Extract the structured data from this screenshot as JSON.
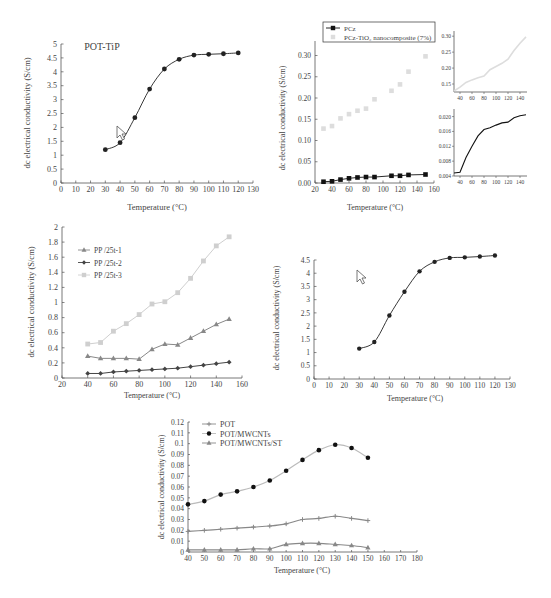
{
  "figure": {
    "caption_text": ""
  },
  "chart_data": [
    {
      "id": "panel-a",
      "type": "line",
      "title": "POT-TiP",
      "xlabel": "Temperature (°C)",
      "ylabel": "dc electrical conductivity (S/cm)",
      "xlim": [
        0,
        130
      ],
      "ylim": [
        0,
        5
      ],
      "xticks": [
        0,
        10,
        20,
        30,
        40,
        50,
        60,
        70,
        80,
        90,
        100,
        110,
        120,
        130
      ],
      "yticks": [
        0,
        0.5,
        1,
        1.5,
        2,
        2.5,
        3,
        3.5,
        4,
        4.5,
        5
      ],
      "grid": false,
      "legend": null,
      "annotation": "cursor-arrow near (44, 1.8)",
      "series": [
        {
          "name": "POT-TiP",
          "color": "#222222",
          "marker": "circle",
          "smooth": true,
          "x": [
            30,
            40,
            50,
            60,
            70,
            80,
            90,
            100,
            110,
            120
          ],
          "y": [
            1.2,
            1.45,
            2.35,
            3.38,
            4.1,
            4.45,
            4.6,
            4.63,
            4.65,
            4.68
          ]
        }
      ]
    },
    {
      "id": "panel-b",
      "type": "scatter",
      "title": "",
      "xlabel": "Temperature (°C)",
      "ylabel": "dc electrical conductivity (S/cm)",
      "xlim": [
        20,
        160
      ],
      "ylim": [
        0,
        0.32
      ],
      "xticks": [
        20,
        40,
        60,
        80,
        100,
        120,
        140,
        160
      ],
      "yticks": [
        0.0,
        0.05,
        0.1,
        0.15,
        0.2,
        0.25,
        0.3
      ],
      "ytick_labels": [
        "0.00",
        "0.05",
        "0.10",
        "0.15",
        "0.20",
        "0.25",
        "0.30"
      ],
      "grid": false,
      "legend": {
        "position": "top",
        "entries": [
          "PCz",
          "PCz-TiO₂ nanocomposite (7%)"
        ]
      },
      "series": [
        {
          "name": "PCz",
          "color": "#111111",
          "marker": "square",
          "line": true,
          "x": [
            30,
            40,
            50,
            60,
            70,
            80,
            90,
            110,
            120,
            130,
            150
          ],
          "y": [
            0.003,
            0.004,
            0.008,
            0.011,
            0.013,
            0.014,
            0.014,
            0.017,
            0.017,
            0.019,
            0.02
          ]
        },
        {
          "name": "PCz-TiO₂ nanocomposite (7%)",
          "color": "#dddddd",
          "marker": "square",
          "line": false,
          "x": [
            30,
            40,
            50,
            60,
            70,
            80,
            90,
            110,
            120,
            130,
            150
          ],
          "y": [
            0.128,
            0.134,
            0.152,
            0.162,
            0.17,
            0.175,
            0.197,
            0.217,
            0.232,
            0.262,
            0.298
          ]
        }
      ],
      "insets": [
        {
          "id": "inset-top",
          "xticks": [
            40,
            60,
            80,
            100,
            120,
            140
          ],
          "ytick_labels": [
            "0.15",
            "0.20",
            "0.25",
            "0.30"
          ],
          "yticks": [
            0.15,
            0.2,
            0.25,
            0.3
          ],
          "xlim": [
            30,
            150
          ],
          "ylim": [
            0.125,
            0.31
          ],
          "color": "#dddddd",
          "x": [
            30,
            40,
            50,
            60,
            70,
            80,
            90,
            100,
            110,
            120,
            130,
            140,
            150
          ],
          "y": [
            0.128,
            0.14,
            0.155,
            0.163,
            0.17,
            0.175,
            0.195,
            0.205,
            0.215,
            0.228,
            0.255,
            0.278,
            0.298
          ]
        },
        {
          "id": "inset-bottom",
          "xticks": [
            40,
            60,
            80,
            100,
            120,
            140
          ],
          "ytick_labels": [
            "0.004",
            "0.008",
            "0.012",
            "0.016",
            "0.020"
          ],
          "yticks": [
            0.004,
            0.008,
            0.012,
            0.016,
            0.02
          ],
          "xlim": [
            30,
            150
          ],
          "ylim": [
            0.004,
            0.0215
          ],
          "color": "#111111",
          "x": [
            30,
            40,
            50,
            60,
            70,
            80,
            90,
            100,
            110,
            120,
            130,
            140,
            150
          ],
          "y": [
            0.0048,
            0.005,
            0.009,
            0.012,
            0.0148,
            0.0165,
            0.017,
            0.0177,
            0.0183,
            0.0185,
            0.0197,
            0.0202,
            0.0205
          ]
        }
      ]
    },
    {
      "id": "panel-c",
      "type": "line",
      "title": "",
      "xlabel": "Temperature (°C)",
      "ylabel": "dc electrical conductivity (S/cm)",
      "xlim": [
        20,
        160
      ],
      "ylim": [
        0,
        2
      ],
      "xticks": [
        20,
        40,
        60,
        80,
        100,
        120,
        140,
        160
      ],
      "yticks": [
        0,
        0.2,
        0.4,
        0.6,
        0.8,
        1,
        1.2,
        1.4,
        1.6,
        1.8,
        2
      ],
      "grid": false,
      "legend": {
        "position": "upper-left",
        "entries": [
          "PP /25t-1",
          "PP /25t-2",
          "PP /25t-3"
        ]
      },
      "series": [
        {
          "name": "PP /25t-1",
          "color": "#888888",
          "marker": "triangle",
          "x": [
            40,
            50,
            60,
            70,
            80,
            90,
            100,
            110,
            120,
            130,
            140,
            150
          ],
          "y": [
            0.29,
            0.26,
            0.26,
            0.26,
            0.25,
            0.38,
            0.45,
            0.44,
            0.53,
            0.62,
            0.71,
            0.78
          ]
        },
        {
          "name": "PP /25t-2",
          "color": "#444444",
          "marker": "diamond",
          "x": [
            40,
            50,
            60,
            70,
            80,
            90,
            100,
            110,
            120,
            130,
            140,
            150
          ],
          "y": [
            0.06,
            0.06,
            0.08,
            0.09,
            0.1,
            0.11,
            0.12,
            0.13,
            0.15,
            0.17,
            0.19,
            0.21
          ]
        },
        {
          "name": "PP /25t-3",
          "color": "#cfcfcf",
          "marker": "square",
          "x": [
            40,
            50,
            60,
            70,
            80,
            90,
            100,
            110,
            120,
            130,
            140,
            150
          ],
          "y": [
            0.45,
            0.47,
            0.62,
            0.72,
            0.84,
            0.98,
            1.01,
            1.13,
            1.32,
            1.55,
            1.75,
            1.87
          ]
        }
      ]
    },
    {
      "id": "panel-d",
      "type": "line",
      "title": "",
      "xlabel": "Temperature (°C)",
      "ylabel": "dc electrical conductivity (S/cm)",
      "xlim": [
        0,
        130
      ],
      "ylim": [
        0,
        4.5
      ],
      "xticks": [
        0,
        10,
        20,
        30,
        40,
        50,
        60,
        70,
        80,
        90,
        100,
        110,
        120,
        130
      ],
      "yticks": [
        0,
        0.5,
        1,
        1.5,
        2,
        2.5,
        3,
        3.5,
        4,
        4.5
      ],
      "grid": false,
      "legend": null,
      "annotation": "cursor-arrow near (30, 4.0)",
      "series": [
        {
          "name": "series",
          "color": "#222222",
          "marker": "circle",
          "smooth": true,
          "x": [
            30,
            40,
            50,
            60,
            70,
            80,
            90,
            100,
            110,
            120
          ],
          "y": [
            1.15,
            1.4,
            2.4,
            3.3,
            4.07,
            4.43,
            4.58,
            4.6,
            4.63,
            4.67
          ]
        }
      ]
    },
    {
      "id": "panel-e",
      "type": "line",
      "title": "",
      "xlabel": "Temperature (°C)",
      "ylabel": "dc electrical conductivity (S/cm)",
      "xlim": [
        40,
        180
      ],
      "ylim": [
        0,
        0.12
      ],
      "xticks": [
        40,
        50,
        60,
        70,
        80,
        90,
        100,
        110,
        120,
        130,
        140,
        150,
        160,
        170,
        180
      ],
      "yticks": [
        0,
        0.01,
        0.02,
        0.03,
        0.04,
        0.05,
        0.06,
        0.07,
        0.08,
        0.09,
        0.1,
        0.11,
        0.12
      ],
      "grid": false,
      "legend": {
        "position": "upper-left",
        "entries": [
          "POT",
          "POT/MWCNTs",
          "POT/MWCNTs/ST"
        ]
      },
      "series": [
        {
          "name": "POT",
          "color": "#888888",
          "marker": "plus",
          "smooth": true,
          "x": [
            40,
            50,
            60,
            70,
            80,
            90,
            100,
            110,
            120,
            130,
            140,
            150
          ],
          "y": [
            0.019,
            0.02,
            0.021,
            0.022,
            0.023,
            0.024,
            0.026,
            0.03,
            0.031,
            0.033,
            0.031,
            0.029
          ]
        },
        {
          "name": "POT/MWCNTs",
          "color": "#111111",
          "marker": "circle",
          "line_color": "#bbbbbb",
          "smooth": true,
          "x": [
            40,
            50,
            60,
            70,
            80,
            90,
            100,
            110,
            120,
            130,
            140,
            150
          ],
          "y": [
            0.044,
            0.047,
            0.053,
            0.056,
            0.06,
            0.066,
            0.075,
            0.085,
            0.094,
            0.099,
            0.096,
            0.087
          ]
        },
        {
          "name": "POT/MWCNTs/ST",
          "color": "#888888",
          "marker": "triangle",
          "smooth": true,
          "x": [
            40,
            50,
            60,
            70,
            80,
            90,
            100,
            110,
            120,
            130,
            140,
            150
          ],
          "y": [
            0.002,
            0.002,
            0.002,
            0.002,
            0.003,
            0.003,
            0.007,
            0.008,
            0.008,
            0.007,
            0.006,
            0.004
          ]
        }
      ]
    }
  ]
}
